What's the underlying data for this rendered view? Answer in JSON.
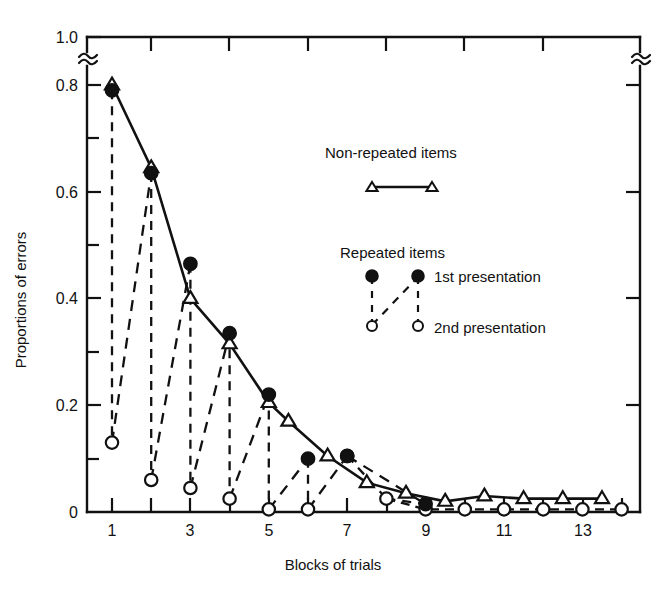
{
  "chart_data": {
    "type": "line",
    "title": "",
    "xlabel": "Blocks of trials",
    "ylabel": "Proportions of errors",
    "xlim": [
      0.4,
      14.6
    ],
    "ylim": [
      0,
      1.0
    ],
    "y_axis_break": true,
    "y_axis_break_between": [
      0.8,
      1.0
    ],
    "grid": false,
    "legend_position": "upper-right-inside",
    "x": [
      1,
      2,
      3,
      4,
      5,
      6,
      7,
      8,
      9,
      10,
      11,
      12,
      13,
      14
    ],
    "xticks": [
      1,
      2,
      3,
      4,
      5,
      6,
      7,
      8,
      9,
      10,
      11,
      12,
      13,
      14
    ],
    "xtick_labels": [
      "1",
      "",
      "3",
      "",
      "5",
      "",
      "7",
      "",
      "9",
      "",
      "11",
      "",
      "13",
      ""
    ],
    "yticks": [
      0,
      0.1,
      0.2,
      0.3,
      0.4,
      0.5,
      0.6,
      0.7,
      0.8,
      1.0
    ],
    "ytick_labels": [
      "0",
      "",
      "0.2",
      "",
      "0.4",
      "",
      "0.6",
      "",
      "0.8",
      "1.0"
    ],
    "series": [
      {
        "name": "Non-repeated items",
        "marker": "open-triangle",
        "line": "solid",
        "x": [
          1,
          2,
          3,
          4,
          5,
          5.5,
          6.5,
          7.5,
          8.5,
          9.5,
          10.5,
          11.5,
          12.5,
          13.5
        ],
        "values": [
          0.8,
          0.645,
          0.4,
          0.315,
          0.205,
          0.17,
          0.105,
          0.055,
          0.035,
          0.02,
          0.03,
          0.025,
          0.025,
          0.025
        ]
      },
      {
        "name": "Repeated items - 1st presentation",
        "marker": "filled-circle",
        "line": "dashed",
        "x": [
          1,
          2,
          3,
          4,
          5,
          6,
          7,
          9
        ],
        "values": [
          0.79,
          0.635,
          0.465,
          0.335,
          0.22,
          0.1,
          0.105,
          0.015
        ]
      },
      {
        "name": "Repeated items - 2nd presentation",
        "marker": "open-circle",
        "line": "dashed",
        "x": [
          1,
          2,
          3,
          4,
          5,
          6,
          7,
          8,
          9,
          10,
          11,
          12,
          13,
          14
        ],
        "values": [
          0.13,
          0.06,
          0.045,
          0.025,
          0.005,
          0.005,
          0.105,
          0.025,
          0.005,
          0.005,
          0.005,
          0.005,
          0.005,
          0.005
        ]
      }
    ]
  },
  "legend": {
    "nonrepeated_title": "Non-repeated items",
    "repeated_title": "Repeated items",
    "first_presentation": "1st presentation",
    "second_presentation": "2nd presentation"
  },
  "axes": {
    "xlabel": "Blocks of trials",
    "ylabel": "Proportions of errors",
    "ytick_1": "1.0",
    "ytick_08": "0.8",
    "ytick_06": "0.6",
    "ytick_04": "0.4",
    "ytick_02": "0.2",
    "ytick_0": "0",
    "xtick_1": "1",
    "xtick_3": "3",
    "xtick_5": "5",
    "xtick_7": "7",
    "xtick_9": "9",
    "xtick_11": "11",
    "xtick_13": "13"
  },
  "colors": {
    "ink": "#111111",
    "background": "#ffffff"
  }
}
